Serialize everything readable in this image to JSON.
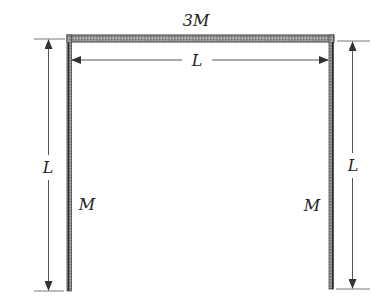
{
  "figure": {
    "type": "structural frame diagram (inverted U / portal frame)",
    "colors": {
      "beam_fill": "#8a8a8a",
      "beam_edge": "#3a3a3a",
      "dimension_line": "#555555",
      "text": "#222222",
      "background": "#ffffff"
    },
    "members": {
      "top_beam": {
        "label": "3M",
        "length_label": "L"
      },
      "left_leg": {
        "label": "M",
        "length_label": "L"
      },
      "right_leg": {
        "label": "M",
        "length_label": "L"
      }
    },
    "labels": {
      "top_mass": "3M",
      "horizontal_length": "L",
      "left_length": "L",
      "left_mass": "M",
      "right_length": "L",
      "right_mass": "M"
    }
  }
}
